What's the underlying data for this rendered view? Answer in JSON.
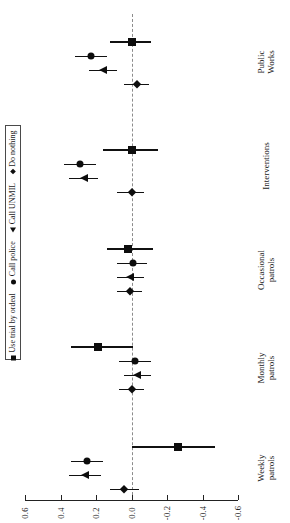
{
  "chart_data": {
    "type": "scatter",
    "title": "",
    "subtitle": "",
    "orientation": "horizontal-rotated",
    "xlabel": "",
    "ylabel": "",
    "xlim": [
      0.6,
      -0.6
    ],
    "axis_direction": "decreasing",
    "grid": false,
    "zero_reference_line": 0.0,
    "tick_labels": [
      "0.6",
      "0.4",
      "0.2",
      "0.0",
      "-0.2",
      "-0.4",
      "-0.6"
    ],
    "tick_values": [
      0.6,
      0.4,
      0.2,
      0.0,
      -0.2,
      -0.4,
      -0.6
    ],
    "categories": [
      "Weekly patrols",
      "Monthly patrols",
      "Occasional patrols",
      "Interventions",
      "Public Works"
    ],
    "legend_position": "left",
    "legend_entries": [
      {
        "label": "Use trial by ordeal",
        "marker": "square"
      },
      {
        "label": "Call police",
        "marker": "circle"
      },
      {
        "label": "Call UNMIL",
        "marker": "triangle"
      },
      {
        "label": "Do nothing",
        "marker": "diamond"
      }
    ],
    "series": [
      {
        "name": "Use trial by ordeal",
        "marker": "square",
        "values": [
          -0.26,
          0.19,
          0.02,
          0.0,
          0.0
        ],
        "ci_low": [
          -0.47,
          -0.01,
          -0.12,
          -0.15,
          -0.11
        ],
        "ci_high": [
          0.0,
          0.34,
          0.14,
          0.16,
          0.12
        ]
      },
      {
        "name": "Call police",
        "marker": "circle",
        "values": [
          0.25,
          -0.02,
          -0.01,
          0.29,
          0.23
        ],
        "ci_low": [
          0.16,
          -0.11,
          -0.09,
          0.2,
          0.14
        ],
        "ci_high": [
          0.34,
          0.07,
          0.08,
          0.38,
          0.32
        ]
      },
      {
        "name": "Call UNMIL",
        "marker": "triangle",
        "values": [
          0.26,
          -0.03,
          0.01,
          0.27,
          0.16
        ],
        "ci_low": [
          0.17,
          -0.11,
          -0.07,
          0.19,
          0.08
        ],
        "ci_high": [
          0.35,
          0.04,
          0.08,
          0.35,
          0.24
        ]
      },
      {
        "name": "Do nothing",
        "marker": "diamond",
        "values": [
          0.04,
          0.0,
          0.01,
          0.0,
          -0.03
        ],
        "ci_low": [
          -0.04,
          -0.07,
          -0.06,
          -0.07,
          -0.1
        ],
        "ci_high": [
          0.12,
          0.07,
          0.08,
          0.08,
          0.04
        ]
      }
    ]
  }
}
